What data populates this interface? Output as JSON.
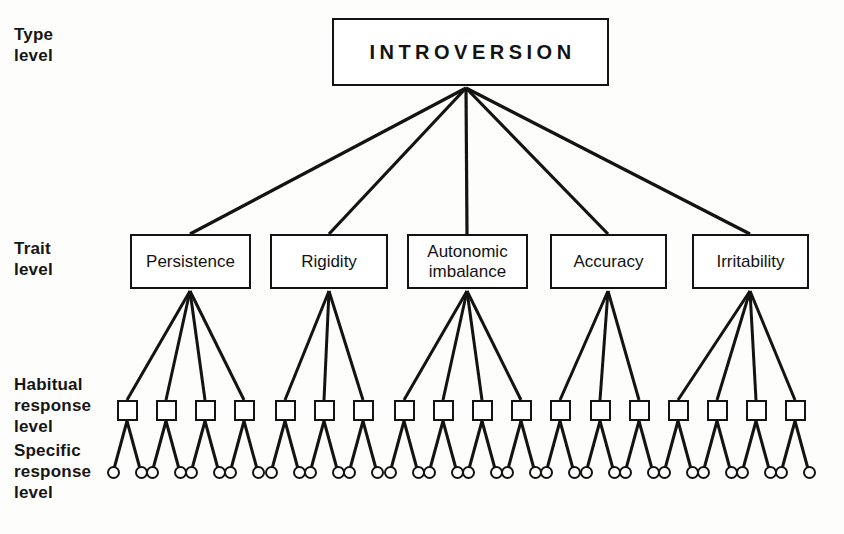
{
  "figure": {
    "background_color": "#fdfdfb",
    "line_color": "#131313",
    "title_node": "INTROVERSION"
  },
  "level_labels": {
    "type": "Type\nlevel",
    "trait": "Trait\nlevel",
    "habitual": "Habitual\nresponse\nlevel",
    "specific": "Specific\nresponse\nlevel"
  },
  "type_level": {
    "label": "INTROVERSION",
    "box": {
      "x": 332,
      "y": 18,
      "w": 277,
      "h": 68
    },
    "apex": {
      "x": 466,
      "y": 88
    }
  },
  "trait_level": {
    "traits": [
      {
        "label": "Persistence",
        "box": {
          "x": 130,
          "y": 234,
          "w": 121,
          "h": 55
        },
        "apex": {
          "x": 190,
          "y": 291
        },
        "habit_count": 4
      },
      {
        "label": "Rigidity",
        "box": {
          "x": 270,
          "y": 234,
          "w": 118,
          "h": 55
        },
        "apex": {
          "x": 329,
          "y": 291
        },
        "habit_count": 3
      },
      {
        "label": "Autonomic\nimbalance",
        "box": {
          "x": 407,
          "y": 234,
          "w": 121,
          "h": 55
        },
        "apex": {
          "x": 467,
          "y": 291
        },
        "habit_count": 4
      },
      {
        "label": "Accuracy",
        "box": {
          "x": 550,
          "y": 234,
          "w": 117,
          "h": 55
        },
        "apex": {
          "x": 608,
          "y": 291
        },
        "habit_count": 3
      },
      {
        "label": "Irritability",
        "box": {
          "x": 692,
          "y": 234,
          "w": 117,
          "h": 55
        },
        "apex": {
          "x": 750,
          "y": 291
        },
        "habit_count": 4
      }
    ]
  },
  "habitual_level": {
    "count": 18,
    "box_size": 21,
    "box_y": 400,
    "centers_x": [
      127,
      166,
      205,
      244,
      285,
      324,
      363,
      404,
      443,
      482,
      521,
      560,
      600,
      639,
      678,
      717,
      756,
      795
    ]
  },
  "specific_level": {
    "count": 36,
    "circle_diameter": 13,
    "circle_y": 466,
    "per_habit": 2,
    "offset_x": 14,
    "centers_x": [
      113,
      141,
      152,
      180,
      191,
      219,
      230,
      258,
      271,
      299,
      310,
      338,
      349,
      377,
      390,
      418,
      429,
      457,
      468,
      496,
      507,
      535,
      546,
      574,
      586,
      614,
      625,
      653,
      664,
      692,
      703,
      731,
      742,
      770,
      781,
      809
    ]
  }
}
